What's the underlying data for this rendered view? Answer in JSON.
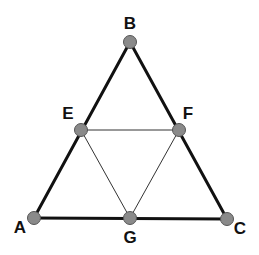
{
  "diagram": {
    "type": "triangle-midpoint-subdivision",
    "colors": {
      "background": "#ffffff",
      "outer_edge": "#111111",
      "inner_edge": "#333333",
      "node_fill": "#8a8a8a",
      "node_stroke": "#555555",
      "label": "#111111"
    },
    "nodes": [
      {
        "id": "A",
        "label": "A",
        "x": 34,
        "y": 218,
        "label_x": 20,
        "label_y": 233
      },
      {
        "id": "B",
        "label": "B",
        "x": 130,
        "y": 42,
        "label_x": 130,
        "label_y": 29
      },
      {
        "id": "C",
        "label": "C",
        "x": 227,
        "y": 219,
        "label_x": 240,
        "label_y": 234
      },
      {
        "id": "E",
        "label": "E",
        "x": 81,
        "y": 130,
        "label_x": 68,
        "label_y": 119
      },
      {
        "id": "F",
        "label": "F",
        "x": 179,
        "y": 130,
        "label_x": 188,
        "label_y": 119
      },
      {
        "id": "G",
        "label": "G",
        "x": 130,
        "y": 218,
        "label_x": 130,
        "label_y": 243
      }
    ],
    "outer_edges": [
      {
        "from": "A",
        "to": "B"
      },
      {
        "from": "B",
        "to": "C"
      },
      {
        "from": "A",
        "to": "C"
      }
    ],
    "inner_edges": [
      {
        "from": "E",
        "to": "F"
      },
      {
        "from": "E",
        "to": "G"
      },
      {
        "from": "F",
        "to": "G"
      }
    ]
  }
}
